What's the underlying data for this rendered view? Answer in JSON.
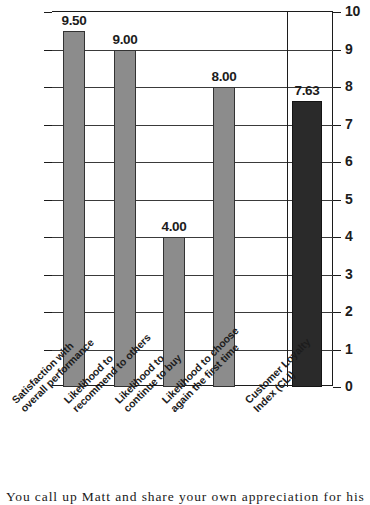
{
  "chart_data": {
    "type": "bar",
    "title": "",
    "xlabel": "",
    "ylabel": "",
    "ylim": [
      0,
      10
    ],
    "grid": true,
    "legend": "none",
    "categories": [
      "Satisfaction with overall performance",
      "Likelihood to recommend to others",
      "Likelihood to continue to buy",
      "Likelihood to choose again the first time",
      "Customer Loyalty Index (CLI)"
    ],
    "values": [
      9.5,
      9.0,
      4.0,
      8.0,
      7.63
    ],
    "value_labels": [
      "9.50",
      "9.00",
      "4.00",
      "8.00",
      "7.63"
    ],
    "ytick_labels": [
      "10",
      "9",
      "8",
      "7",
      "6",
      "5",
      "4",
      "3",
      "2",
      "1",
      "0"
    ],
    "ytick_values": [
      10,
      9,
      8,
      7,
      6,
      5,
      4,
      3,
      2,
      1,
      0
    ],
    "bar_colors": [
      "#8c8c8c",
      "#8c8c8c",
      "#8c8c8c",
      "#8c8c8c",
      "#2a2a2a"
    ],
    "axis_position": "right"
  },
  "axis": {
    "ticks": [
      {
        "label": "10",
        "value": 10
      },
      {
        "label": "9",
        "value": 9
      },
      {
        "label": "8",
        "value": 8
      },
      {
        "label": "7",
        "value": 7
      },
      {
        "label": "6",
        "value": 6
      },
      {
        "label": "5",
        "value": 5
      },
      {
        "label": "4",
        "value": 4
      },
      {
        "label": "3",
        "value": 3
      },
      {
        "label": "2",
        "value": 2
      },
      {
        "label": "1",
        "value": 1
      },
      {
        "label": "0",
        "value": 0
      }
    ]
  },
  "bars": [
    {
      "value_label": "9.50",
      "line1": "Satisfaction with",
      "line2": "overall performance",
      "bold": false,
      "color": "#8c8c8c"
    },
    {
      "value_label": "9.00",
      "line1": "Likelihood to",
      "line2": "recommend to others",
      "bold": false,
      "color": "#8c8c8c"
    },
    {
      "value_label": "4.00",
      "line1": "Likelihood to",
      "line2": "continue to buy",
      "bold": false,
      "color": "#8c8c8c"
    },
    {
      "value_label": "8.00",
      "line1": "Likelihood to choose",
      "line2": "again the first time",
      "bold": false,
      "color": "#8c8c8c"
    },
    {
      "value_label": "7.63",
      "line1": "Customer Loyalty",
      "line2": "Index (CLI)",
      "bold": true,
      "color": "#2a2a2a"
    }
  ],
  "caption": {
    "text": "You call up Matt and share your own appreciation for his"
  }
}
